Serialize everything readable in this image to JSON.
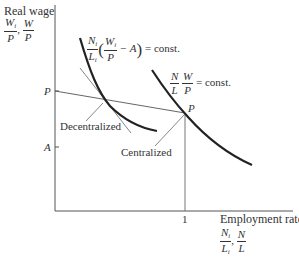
{
  "figure": {
    "y_axis": {
      "title": "Real wage",
      "fraction_1": {
        "num": "W",
        "num_sub": "i",
        "den": "P"
      },
      "separator": ",",
      "fraction_2": {
        "num": "W",
        "den": "P"
      },
      "ticks": [
        {
          "label": "P"
        },
        {
          "label": "A"
        }
      ]
    },
    "x_axis": {
      "title": "Employment rate",
      "fraction_1": {
        "num": "N",
        "num_sub": "i",
        "den": "L",
        "den_sub": "i"
      },
      "separator": ",",
      "fraction_2": {
        "num": "N",
        "den": "L"
      },
      "ticks": [
        {
          "label": "1"
        }
      ]
    },
    "curves": [
      {
        "name": "decentralized-isoprofit",
        "label_parts": {
          "n": "N",
          "n_sub": "i",
          "l": "L",
          "l_sub": "i",
          "w": "W",
          "w_sub": "i",
          "p": "P",
          "minus": "− A",
          "rhs": "= const."
        }
      },
      {
        "name": "centralized-isocurve",
        "label_parts": {
          "n": "N",
          "l": "L",
          "w": "W",
          "p": "P",
          "rhs": "= const."
        }
      }
    ],
    "points": [
      {
        "label": "P",
        "name": "centralized-equilibrium"
      }
    ],
    "annotations": {
      "decentralized": "Decentralized",
      "centralized": "Centralized"
    }
  }
}
